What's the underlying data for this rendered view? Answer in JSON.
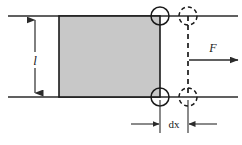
{
  "figure": {
    "width": 242,
    "height": 145,
    "background_color": "#ffffff"
  },
  "colors": {
    "line": "#2b2b2b",
    "block_fill": "#c8c8c8",
    "block_stroke": "#1a1a1a",
    "text": "#1a1a1a",
    "guide_line": "#555555"
  },
  "labels": {
    "length_label": "l",
    "force_label": "F",
    "displacement_label": "dx"
  },
  "geometry": {
    "top_rail_y": 16,
    "bottom_rail_y": 97,
    "rail_x_start": 8,
    "rail_x_end": 238,
    "block_x": 59,
    "block_y": 16,
    "block_width": 101,
    "block_height": 81,
    "roller_radius": 9,
    "roller_solid_x": 160,
    "roller_dashed_x": 188,
    "dimension_line_x": 35,
    "force_arrow_y": 60,
    "force_arrow_x_start": 189,
    "force_arrow_x_end": 238,
    "dx_dimension_y": 124,
    "dx_extension_top": 100,
    "dx_left_x": 160,
    "dx_right_x": 188
  },
  "elements": {
    "top_rail_name": "top-guide-rail",
    "bottom_rail_name": "bottom-guide-rail",
    "block_name": "sliding-block",
    "solid_roller_top_name": "roller-top-initial",
    "solid_roller_bottom_name": "roller-bottom-initial",
    "dashed_roller_top_name": "roller-top-displaced",
    "dashed_roller_bottom_name": "roller-bottom-displaced",
    "dashed_edge_name": "displaced-edge-line",
    "length_dimension_name": "length-dimension",
    "force_vector_name": "force-vector",
    "dx_dimension_name": "displacement-dimension"
  }
}
